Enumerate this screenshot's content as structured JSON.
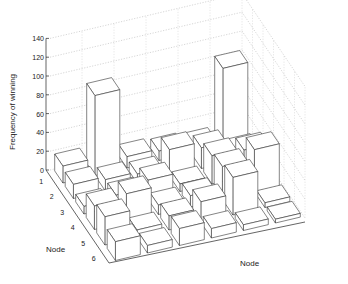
{
  "chart_data": {
    "type": "bar3d",
    "title": "",
    "zlabel": "Frequency of winning",
    "xlabel": "Node",
    "ylabel": "Node",
    "z_ticks": [
      0,
      20,
      40,
      60,
      80,
      100,
      120,
      140
    ],
    "zlim": [
      0,
      140
    ],
    "row_ticks": [
      "1",
      "2",
      "3",
      "4",
      "5",
      "6"
    ],
    "col_ticks": [],
    "grid": true,
    "rows": [
      "1",
      "2",
      "3",
      "4",
      "5",
      "6"
    ],
    "cols": [
      "1",
      "2",
      "3",
      "4",
      "5",
      "6"
    ],
    "values": [
      [
        18,
        85,
        12,
        10,
        8,
        82
      ],
      [
        15,
        12,
        10,
        28,
        22,
        10
      ],
      [
        8,
        12,
        20,
        8,
        30,
        28
      ],
      [
        25,
        30,
        10,
        12,
        35,
        45
      ],
      [
        30,
        8,
        15,
        22,
        40,
        5
      ],
      [
        20,
        8,
        18,
        10,
        6,
        4
      ]
    ]
  }
}
